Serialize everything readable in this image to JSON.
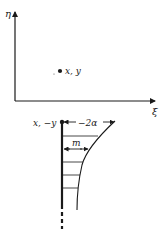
{
  "figure": {
    "top_plot": {
      "vertical_axis_label": "η",
      "horizontal_axis_label": "ξ",
      "point_label": "x, y"
    },
    "bottom_plot": {
      "image_point_label": "x, −y",
      "width_label": "−2α",
      "inner_width_label": "m"
    },
    "colors": {
      "ink": "#1a1a1a",
      "background": "#ffffff"
    }
  }
}
